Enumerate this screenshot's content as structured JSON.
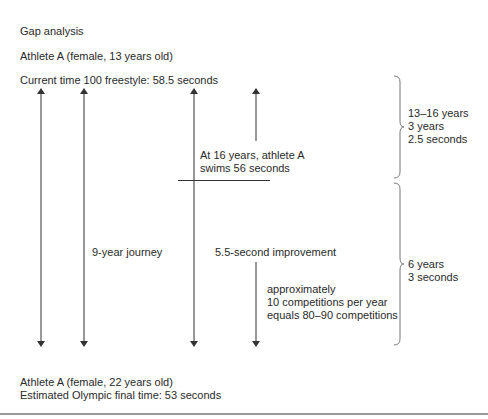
{
  "title": "Gap analysis",
  "start": {
    "athlete": "Athlete A (female, 13 years old)",
    "current_time": "Current time 100 freestyle: 58.5 seconds"
  },
  "milestone": {
    "line1": "At 16 years, athlete A",
    "line2": "swims 56 seconds"
  },
  "journey_label": "9-year journey",
  "improvement_label": "5.5-second improvement",
  "competitions": {
    "line1": "approximately",
    "line2": "10 competitions per year",
    "line3": "equals 80–90 competitions"
  },
  "brace_upper": {
    "line1": "13–16 years",
    "line2": "3 years",
    "line3": "2.5 seconds"
  },
  "brace_lower": {
    "line1": "6 years",
    "line2": "3 seconds"
  },
  "end": {
    "athlete": "Athlete A (female, 22 years old)",
    "final_time": "Estimated Olympic final time: 53 seconds"
  },
  "colors": {
    "text": "#2a2a2a",
    "line": "#333333",
    "brace": "#777777",
    "rule": "#9a9a9a"
  }
}
